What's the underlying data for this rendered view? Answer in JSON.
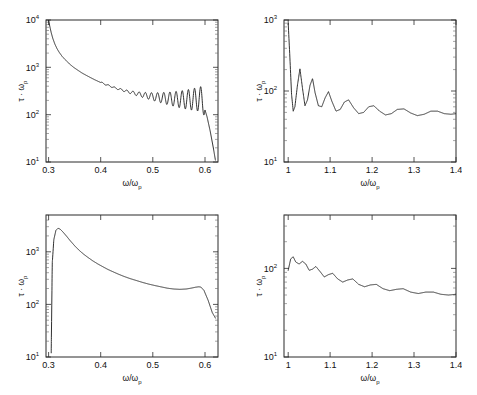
{
  "figure": {
    "background": "#ffffff",
    "line_color": "#1a1a1a",
    "axis_color": "#2b2b2b",
    "panel_count": 4
  },
  "chart_data": [
    {
      "type": "line",
      "panel": "top-left",
      "title": "",
      "xlabel": "ω/ωp",
      "ylabel": "τ · ωp",
      "xscale": "linear",
      "yscale": "log",
      "xlim": [
        0.295,
        0.625
      ],
      "ylim": [
        10,
        10000
      ],
      "xticks": [
        0.3,
        0.4,
        0.5,
        0.6
      ],
      "xticklabels": [
        "0.3",
        "0.4",
        "0.5",
        "0.6"
      ],
      "yticks": [
        10,
        100,
        1000,
        10000
      ],
      "yticklabels": [
        "10^1",
        "10^2",
        "10^3",
        "10^4"
      ],
      "grid": false,
      "legend": null,
      "description": "Steeply decaying curve from 1e4 at 0.30 with growing-amplitude oscillations toward 0.59, a tall spike near 0.592, then sharp drop to 1e1 at 0.62",
      "series": [
        {
          "name": "tau-omega-p",
          "x": [
            0.3,
            0.302,
            0.305,
            0.308,
            0.312,
            0.316,
            0.32,
            0.326,
            0.332,
            0.34,
            0.348,
            0.356,
            0.364,
            0.372,
            0.38,
            0.388,
            0.396,
            0.404,
            0.412,
            0.42,
            0.428,
            0.436,
            0.444,
            0.452,
            0.46,
            0.468,
            0.476,
            0.484,
            0.492,
            0.5,
            0.508,
            0.516,
            0.524,
            0.532,
            0.54,
            0.548,
            0.556,
            0.562,
            0.568,
            0.574,
            0.58,
            0.586,
            0.592,
            0.598,
            0.604,
            0.61,
            0.616,
            0.62
          ],
          "y": [
            10000,
            7600,
            5400,
            4100,
            3100,
            2500,
            2100,
            1700,
            1450,
            1180,
            1000,
            870,
            760,
            680,
            610,
            550,
            500,
            455,
            420,
            390,
            360,
            340,
            320,
            300,
            285,
            270,
            258,
            246,
            236,
            226,
            218,
            210,
            203,
            197,
            191,
            186,
            182,
            180,
            178,
            177,
            176,
            176,
            176,
            150,
            90,
            45,
            20,
            11
          ],
          "oscillation": {
            "present": true,
            "start_x": 0.4,
            "end_x": 0.6,
            "period": 0.0118,
            "amplitude_start_ratio": 1.06,
            "amplitude_end_ratio": 3.2
          }
        }
      ]
    },
    {
      "type": "line",
      "panel": "top-right",
      "title": "",
      "xlabel": "ω/ωp",
      "ylabel": "τ · ωp",
      "xscale": "linear",
      "yscale": "log",
      "xlim": [
        0.99,
        1.4
      ],
      "ylim": [
        10,
        1000
      ],
      "xticks": [
        1.0,
        1.1,
        1.2,
        1.3,
        1.4
      ],
      "xticklabels": [
        "1",
        "1.1",
        "1.2",
        "1.3",
        "1.4"
      ],
      "yticks": [
        10,
        100,
        1000
      ],
      "yticklabels": [
        "10^1",
        "10^2",
        "10^3"
      ],
      "grid": false,
      "legend": null,
      "description": "Sharp spike to near 1e3 at x=1.00, then strongly damped oscillations settling to a flat baseline near 48",
      "series": [
        {
          "name": "tau-omega-p",
          "x": [
            1.0,
            1.004,
            1.008,
            1.012,
            1.016,
            1.022,
            1.028,
            1.034,
            1.04,
            1.046,
            1.052,
            1.058,
            1.064,
            1.072,
            1.08,
            1.088,
            1.096,
            1.104,
            1.114,
            1.124,
            1.134,
            1.144,
            1.156,
            1.168,
            1.18,
            1.192,
            1.204,
            1.218,
            1.232,
            1.246,
            1.26,
            1.276,
            1.292,
            1.308,
            1.324,
            1.34,
            1.356,
            1.372,
            1.388,
            1.4
          ],
          "y": [
            900,
            300,
            90,
            52,
            60,
            120,
            205,
            110,
            62,
            75,
            120,
            150,
            95,
            62,
            60,
            80,
            98,
            72,
            52,
            55,
            70,
            75,
            58,
            48,
            50,
            60,
            62,
            52,
            46,
            48,
            55,
            56,
            49,
            45,
            47,
            52,
            52,
            48,
            47,
            48
          ],
          "baseline": 48
        }
      ]
    },
    {
      "type": "line",
      "panel": "bottom-left",
      "title": "",
      "xlabel": "ω/ωp",
      "ylabel": "τ · ωp",
      "xscale": "linear",
      "yscale": "log",
      "xlim": [
        0.295,
        0.625
      ],
      "ylim": [
        10,
        5000
      ],
      "xticks": [
        0.3,
        0.4,
        0.5,
        0.6
      ],
      "xticklabels": [
        "0.3",
        "0.4",
        "0.5",
        "0.6"
      ],
      "yticks": [
        10,
        100,
        1000
      ],
      "yticklabels": [
        "10^1",
        "10^2",
        "10^3"
      ],
      "grid": false,
      "legend": null,
      "description": "Vertical rise from bottom near 0.305 to a peak ~2800 at 0.318, smooth monotone decay to ~180 near 0.53, slight bump to ~215 at 0.59, then a fall to ~55 at 0.62",
      "series": [
        {
          "name": "tau-omega-p",
          "x": [
            0.305,
            0.307,
            0.31,
            0.314,
            0.318,
            0.322,
            0.328,
            0.334,
            0.342,
            0.35,
            0.358,
            0.366,
            0.374,
            0.384,
            0.394,
            0.404,
            0.414,
            0.424,
            0.434,
            0.444,
            0.456,
            0.468,
            0.48,
            0.492,
            0.504,
            0.516,
            0.528,
            0.54,
            0.552,
            0.564,
            0.574,
            0.582,
            0.588,
            0.592,
            0.598,
            0.606,
            0.614,
            0.62
          ],
          "y": [
            12,
            600,
            1700,
            2550,
            2800,
            2700,
            2350,
            2000,
            1600,
            1300,
            1080,
            920,
            800,
            680,
            590,
            520,
            460,
            415,
            375,
            342,
            310,
            285,
            262,
            243,
            228,
            215,
            203,
            196,
            193,
            196,
            204,
            212,
            216,
            214,
            185,
            120,
            70,
            55
          ]
        }
      ]
    },
    {
      "type": "line",
      "panel": "bottom-right",
      "title": "",
      "xlabel": "ω/ωp",
      "ylabel": "τ · ωp",
      "xscale": "linear",
      "yscale": "log",
      "xlim": [
        0.99,
        1.4
      ],
      "ylim": [
        10,
        400
      ],
      "xticks": [
        1.0,
        1.1,
        1.2,
        1.3,
        1.4
      ],
      "xticklabels": [
        "1",
        "1.1",
        "1.2",
        "1.3",
        "1.4"
      ],
      "yticks": [
        10,
        100
      ],
      "yticklabels": [
        "10^1",
        "10^2"
      ],
      "grid": false,
      "legend": null,
      "description": "Starts near 95 at x=1, small peak ~135 at 1.01, then gently decaying ripples on a declining baseline settling near 50 at 1.4",
      "series": [
        {
          "name": "tau-omega-p",
          "x": [
            1.0,
            1.006,
            1.012,
            1.018,
            1.026,
            1.034,
            1.042,
            1.05,
            1.058,
            1.066,
            1.076,
            1.086,
            1.096,
            1.106,
            1.118,
            1.13,
            1.142,
            1.154,
            1.168,
            1.182,
            1.196,
            1.21,
            1.226,
            1.242,
            1.258,
            1.274,
            1.292,
            1.31,
            1.328,
            1.346,
            1.364,
            1.382,
            1.4
          ],
          "y": [
            95,
            128,
            135,
            118,
            112,
            120,
            112,
            95,
            98,
            105,
            92,
            80,
            85,
            88,
            76,
            70,
            74,
            76,
            66,
            62,
            65,
            66,
            59,
            56,
            58,
            59,
            54,
            52,
            54,
            54,
            51,
            50,
            51
          ]
        }
      ]
    }
  ]
}
